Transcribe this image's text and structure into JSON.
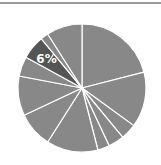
{
  "chart_data": {
    "type": "pie",
    "title": "",
    "start_angle_deg": 0,
    "direction": "clockwise",
    "center": [
      82,
      88
    ],
    "radius": 64,
    "separator_color": "#ffffff",
    "default_color": "#888888",
    "highlight_color": "#555555",
    "slices": [
      {
        "value": 21,
        "label": "",
        "highlight": false
      },
      {
        "value": 14,
        "label": "",
        "highlight": false
      },
      {
        "value": 4,
        "label": "",
        "highlight": false
      },
      {
        "value": 4,
        "label": "",
        "highlight": false
      },
      {
        "value": 3,
        "label": "",
        "highlight": false
      },
      {
        "value": 13,
        "label": "",
        "highlight": false
      },
      {
        "value": 9,
        "label": "",
        "highlight": false
      },
      {
        "value": 10,
        "label": "",
        "highlight": false
      },
      {
        "value": 5,
        "label": "",
        "highlight": false
      },
      {
        "value": 6,
        "label": "6%",
        "highlight": true
      },
      {
        "value": 2,
        "label": "",
        "highlight": false
      },
      {
        "value": 9,
        "label": "",
        "highlight": false
      }
    ],
    "values": [
      21,
      14,
      4,
      4,
      3,
      13,
      9,
      10,
      5,
      6,
      2,
      9
    ],
    "annotations": [
      "6%"
    ],
    "legend": []
  },
  "decor": {
    "top_rule_color": "#9a9a9a"
  }
}
